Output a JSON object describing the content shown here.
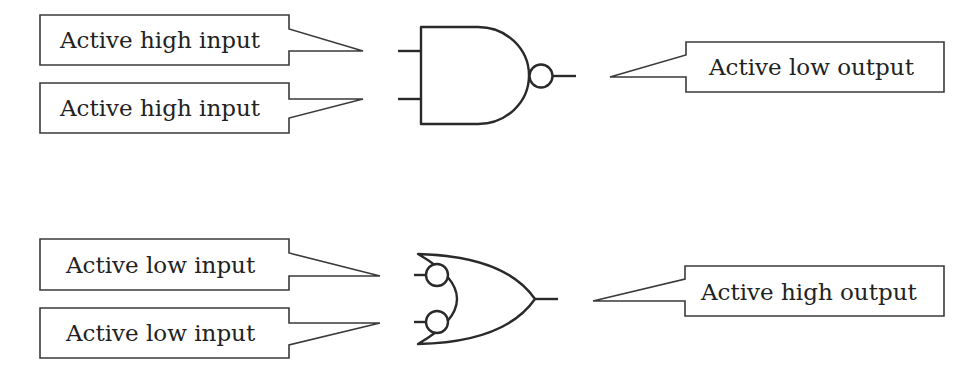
{
  "diagram": {
    "nand_section": {
      "gate_type": "NAND",
      "inputs": [
        {
          "label": "Active high input"
        },
        {
          "label": "Active high input"
        }
      ],
      "output": {
        "label": "Active low output"
      }
    },
    "or_section": {
      "gate_type": "OR with inverted inputs",
      "inputs": [
        {
          "label": "Active low input"
        },
        {
          "label": "Active low input"
        }
      ],
      "output": {
        "label": "Active high output"
      }
    },
    "colors": {
      "line": "#2a2a2a",
      "text": "#222222",
      "background": "#ffffff"
    }
  }
}
